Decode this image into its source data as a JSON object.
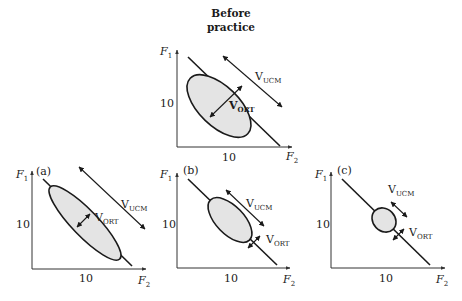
{
  "title_line1": "Before",
  "title_line2": "practice",
  "labels": {
    "y_axis": "F",
    "y_axis_sub": "1",
    "x_axis": "F",
    "x_axis_sub": "2",
    "tick_value": "10",
    "v": "V",
    "ucm_sub": "UCM",
    "ort_sub": "ORT"
  },
  "panels": [
    {
      "id": "before",
      "tag": ""
    },
    {
      "id": "a",
      "tag": "(a)"
    },
    {
      "id": "b",
      "tag": "(b)"
    },
    {
      "id": "c",
      "tag": "(c)"
    }
  ]
}
